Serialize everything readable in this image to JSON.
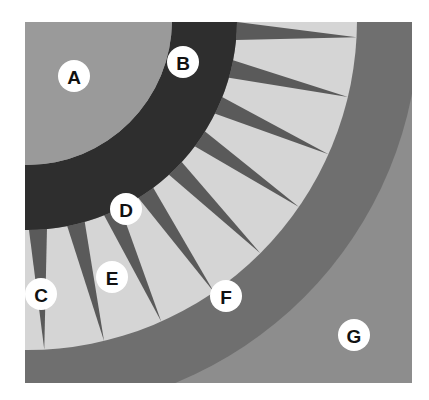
{
  "figure": {
    "canvas": {
      "width": 429,
      "height": 400,
      "background": "#ffffff"
    },
    "plate": {
      "x": 25,
      "y": 22,
      "width": 387,
      "height": 361
    },
    "center": {
      "x": 27,
      "y": 20
    },
    "colors": {
      "background_white": "#ffffff",
      "zone_a_gray": "#9a9a9a",
      "zone_b_dark": "#2e2e2e",
      "spike_dark_gray": "#5a5a5a",
      "zone_e_light": "#d5d5d5",
      "zone_f_ring": "#6f6f6f",
      "zone_g_gray": "#8d8d8d",
      "label_disc": "#ffffff",
      "label_glyph": "#111111"
    },
    "geometry": {
      "zone_a_outer_radius": 210,
      "band_b_inner_radius": 145,
      "band_b_outer_radius": 210,
      "spike_field_inner_radius": 145,
      "spike_field_outer_radius": 330,
      "ring_f_inner_radius": 330,
      "ring_f_outer_radius": 392,
      "spike_count": 9,
      "spike_half_angle_deg": 5.5,
      "spike_start_angle_deg": 3,
      "spike_angle_step_deg": 10.5
    },
    "labels": [
      {
        "id": "A",
        "text": "A",
        "x": 74,
        "y": 76,
        "radius": 16,
        "zone": "outer-gray-quadrant"
      },
      {
        "id": "B",
        "text": "B",
        "x": 183,
        "y": 62,
        "radius": 16,
        "zone": "dark-arc-band"
      },
      {
        "id": "C",
        "text": "C",
        "x": 41,
        "y": 294,
        "radius": 16,
        "zone": "spike-lower-left"
      },
      {
        "id": "D",
        "text": "D",
        "x": 126,
        "y": 209,
        "radius": 16,
        "zone": "spike-mid-left"
      },
      {
        "id": "E",
        "text": "E",
        "x": 112,
        "y": 277,
        "radius": 16,
        "zone": "light-inner-field"
      },
      {
        "id": "F",
        "text": "F",
        "x": 226,
        "y": 296,
        "radius": 16,
        "zone": "outer-ring-band"
      },
      {
        "id": "G",
        "text": "G",
        "x": 354,
        "y": 335,
        "radius": 16,
        "zone": "outermost-gray-field"
      }
    ]
  }
}
